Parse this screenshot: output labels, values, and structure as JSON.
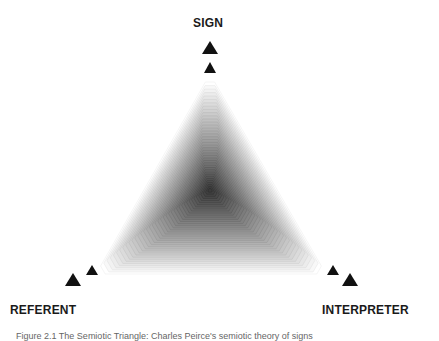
{
  "diagram": {
    "title": "Semiotic triangle",
    "vertices": {
      "top": "SIGN",
      "bottom_left": "REFERENT",
      "bottom_right": "INTERPRETER"
    },
    "caption": "Figure 2.1 The Semiotic Triangle: Charles Peirce's semiotic theory of signs"
  },
  "colors": {
    "marker": "#111111",
    "label": "#1a1a1a",
    "gradient_outer": "#ffffff",
    "gradient_center": "#3a3a3a"
  }
}
